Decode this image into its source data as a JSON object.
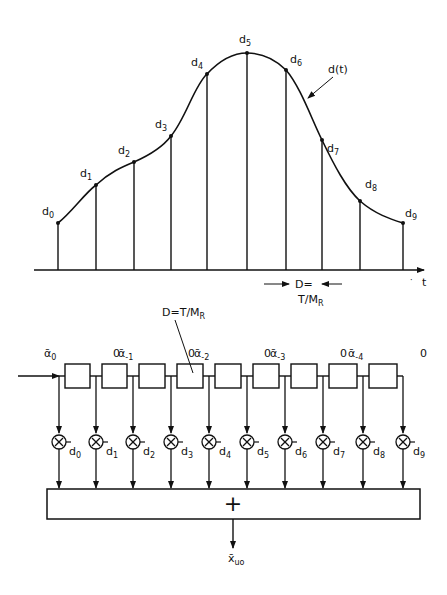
{
  "top_plot": {
    "curve_label": "d(t)",
    "axis_label": "t",
    "spacing_label_1": "D=",
    "spacing_label_2": "T/M",
    "spacing_label_2_sub": "R",
    "samples": [
      {
        "name": "d",
        "sub": "0",
        "x": 58,
        "y": 223
      },
      {
        "name": "d",
        "sub": "1",
        "x": 96,
        "y": 185
      },
      {
        "name": "d",
        "sub": "2",
        "x": 134,
        "y": 162
      },
      {
        "name": "d",
        "sub": "3",
        "x": 171,
        "y": 136
      },
      {
        "name": "d",
        "sub": "4",
        "x": 207,
        "y": 74
      },
      {
        "name": "d",
        "sub": "5",
        "x": 247,
        "y": 53
      },
      {
        "name": "d",
        "sub": "6",
        "x": 286,
        "y": 70
      },
      {
        "name": "d",
        "sub": "7",
        "x": 322,
        "y": 140
      },
      {
        "name": "d",
        "sub": "8",
        "x": 360,
        "y": 201
      },
      {
        "name": "d",
        "sub": "9",
        "x": 403,
        "y": 223
      }
    ]
  },
  "filter": {
    "delay_label": "D=T/M",
    "delay_label_sub": "R",
    "sum_symbol": "+",
    "output_label": "x̄",
    "output_label_sub": "uo",
    "input_labels": [
      {
        "text": "ᾱ",
        "sub": "0"
      },
      {
        "text": "0",
        "sub": ""
      },
      {
        "text": "ᾱ",
        "sub": "-1"
      },
      {
        "text": "0",
        "sub": ""
      },
      {
        "text": "ᾱ",
        "sub": "-2"
      },
      {
        "text": "0",
        "sub": ""
      },
      {
        "text": "ᾱ",
        "sub": "-3"
      },
      {
        "text": "0",
        "sub": ""
      },
      {
        "text": "ᾱ",
        "sub": "-4"
      },
      {
        "text": "0",
        "sub": ""
      }
    ],
    "taps": [
      {
        "coef": "d",
        "sub": "0"
      },
      {
        "coef": "d",
        "sub": "1"
      },
      {
        "coef": "d",
        "sub": "2"
      },
      {
        "coef": "d",
        "sub": "3"
      },
      {
        "coef": "d",
        "sub": "4"
      },
      {
        "coef": "d",
        "sub": "5"
      },
      {
        "coef": "d",
        "sub": "6"
      },
      {
        "coef": "d",
        "sub": "7"
      },
      {
        "coef": "d",
        "sub": "8"
      },
      {
        "coef": "d",
        "sub": "9"
      }
    ]
  }
}
